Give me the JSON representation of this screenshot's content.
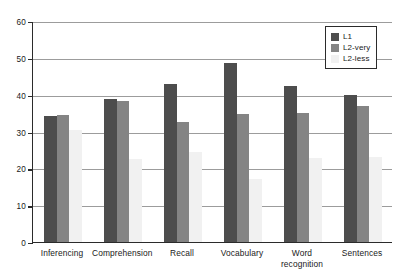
{
  "chart_data": {
    "type": "bar",
    "title": "",
    "subtitle": "",
    "xlabel": "",
    "ylabel": "",
    "ylim": [
      0,
      60
    ],
    "yticks": [
      0,
      10,
      20,
      30,
      40,
      50,
      60
    ],
    "grid": true,
    "legend_position": "top-right",
    "categories": [
      "Inferencing",
      "Comprehension",
      "Recall",
      "Vocabulary",
      "Word recognition",
      "Sentences"
    ],
    "category_lines": [
      [
        "Inferencing"
      ],
      [
        "Comprehension"
      ],
      [
        "Recall"
      ],
      [
        "Vocabulary"
      ],
      [
        "Word",
        "recognition"
      ],
      [
        "Sentences"
      ]
    ],
    "series": [
      {
        "name": "L1",
        "color": "#4d4d4d",
        "values": [
          34.2,
          38.7,
          43.0,
          48.5,
          42.3,
          40.0
        ]
      },
      {
        "name": "L2-very",
        "color": "#848484",
        "values": [
          34.6,
          38.4,
          32.5,
          34.8,
          35.0,
          37.0
        ]
      },
      {
        "name": "L2-less",
        "color": "#f1f1f1",
        "values": [
          30.3,
          22.5,
          24.5,
          17.0,
          22.8,
          23.0
        ]
      }
    ]
  },
  "legend": {
    "items": [
      {
        "label": "L1",
        "swatch": "s0"
      },
      {
        "label": "L2-very",
        "swatch": "s1"
      },
      {
        "label": "L2-less",
        "swatch": "s2"
      }
    ]
  }
}
